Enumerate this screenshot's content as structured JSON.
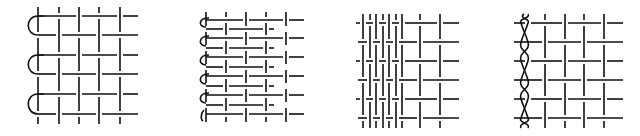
{
  "figure": {
    "background": "#ffffff",
    "stroke_color": "#111111",
    "panels": [
      {
        "id": "panel-1",
        "description": "plain weave with looped left selvedge, 3 loops",
        "verticals_x": [
          38,
          59,
          79,
          99,
          120
        ],
        "rows_y": [
          16,
          35,
          55,
          74,
          94,
          114
        ],
        "x_left": 38,
        "x_right": 138,
        "y_top": 7,
        "y_bottom": 124,
        "loop_pairs": [
          [
            16,
            35
          ],
          [
            55,
            74
          ],
          [
            94,
            114
          ]
        ],
        "loop_radius_x": 9
      },
      {
        "id": "panel-2",
        "description": "dense weft weave with looped left selvedge, 6 loops",
        "verticals_x": [
          206,
          226,
          246,
          266,
          286
        ],
        "rows_y": [
          20,
          29,
          38,
          48,
          57,
          67,
          76,
          86,
          95,
          105,
          114
        ],
        "x_left": 206,
        "x_right": 304,
        "y_top": 12,
        "y_bottom": 122,
        "loop_radius_x": 5
      },
      {
        "id": "panel-3",
        "description": "dense warp weave (left) transitioning to open grid (right)",
        "verticals_x": [
          363,
          370,
          376,
          383,
          389,
          396,
          402,
          420,
          440
        ],
        "rows_y": [
          23,
          42,
          61,
          80,
          99,
          118
        ],
        "x_left": 356,
        "x_right": 459,
        "y_top": 14,
        "y_bottom": 128
      },
      {
        "id": "panel-4",
        "description": "plain weave with braided/twisted left edge",
        "braid_x": [
          521,
          528
        ],
        "verticals_x": [
          545,
          565,
          584,
          604
        ],
        "rows_y": [
          23,
          42,
          61,
          80,
          99,
          118
        ],
        "x_left": 514,
        "x_right": 623,
        "y_top": 14,
        "y_bottom": 128
      }
    ]
  }
}
